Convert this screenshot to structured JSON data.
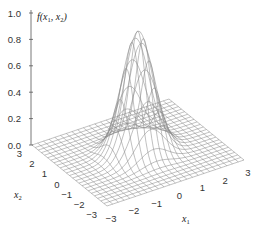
{
  "chart_data": {
    "type": "surface3d-wireframe",
    "title": "",
    "function": "f(x1, x2) = 0.92 * exp(-(x1^2 + x2^2) / (2 * 0.62^2))",
    "zlabel": "f(x₁, x₂)",
    "xlabel": "x₁",
    "ylabel": "x₂",
    "x1_range": [
      -3,
      3
    ],
    "x2_range": [
      -3,
      3
    ],
    "z_range": [
      0.0,
      1.0
    ],
    "z_ticks": [
      "0.0",
      "0.2",
      "0.4",
      "0.6",
      "0.8",
      "1.0"
    ],
    "x1_ticks": [
      "−3",
      "−2",
      "−1",
      "0",
      "1",
      "2",
      "3"
    ],
    "x2_ticks": [
      "3",
      "2",
      "1",
      "0",
      "−1",
      "−2",
      "−3"
    ],
    "peak_value": 0.92,
    "sigma": 0.62,
    "grid_resolution": 25,
    "grid": false,
    "legend": "none",
    "line_color": "#8c8c8c"
  },
  "labels": {
    "z_axis_title": "f(x",
    "z_axis_sub1": "1",
    "z_axis_mid": ", x",
    "z_axis_sub2": "2",
    "z_axis_end": ")",
    "x1_title": "x",
    "x1_sub": "1",
    "x2_title": "x",
    "x2_sub": "2"
  }
}
